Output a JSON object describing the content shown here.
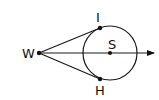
{
  "diagram": {
    "type": "geometry",
    "points": {
      "W": {
        "label": "W"
      },
      "S": {
        "label": "S"
      },
      "I": {
        "label": "I"
      },
      "H": {
        "label": "H"
      }
    },
    "segments": [
      [
        "W",
        "I"
      ],
      [
        "W",
        "H"
      ]
    ],
    "rays": [
      [
        "W",
        "S"
      ]
    ],
    "circle": {
      "center": "S",
      "tangent_points": [
        "I",
        "H"
      ]
    }
  }
}
